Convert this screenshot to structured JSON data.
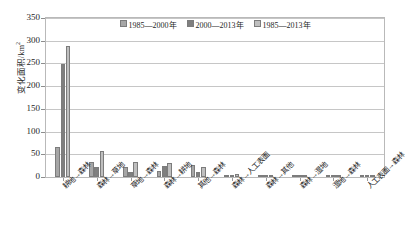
{
  "chart_data": {
    "type": "bar",
    "title": "",
    "xlabel": "",
    "ylabel": "变化面积/km²",
    "ylim": [
      0,
      350
    ],
    "yticks": [
      0,
      50,
      100,
      150,
      200,
      250,
      300,
      350
    ],
    "grid": true,
    "legend_position": "top-center",
    "categories": [
      "耕地→森林",
      "森林→草地",
      "草地→森林",
      "森林→耕地",
      "其他→森林",
      "森林→人工表面",
      "森林→其他",
      "森林→湿地",
      "湿地→森林",
      "人工表面→森林"
    ],
    "series": [
      {
        "name": "1985—2000年",
        "color": "#a6a6a6",
        "values": [
          65,
          33,
          23,
          14,
          27,
          4,
          3,
          1,
          0.8,
          0.4
        ]
      },
      {
        "name": "2000—2013年",
        "color": "#7f7f7f",
        "values": [
          248,
          22,
          12,
          24,
          12,
          5,
          3,
          1,
          0.7,
          0.5
        ]
      },
      {
        "name": "1985—2013年",
        "color": "#bfbfbf",
        "values": [
          288,
          58,
          34,
          30,
          22,
          6,
          4,
          1.5,
          1,
          0.6
        ]
      }
    ]
  },
  "axis": {
    "y_title_main": "变化面积/km",
    "y_title_sup": "2"
  }
}
